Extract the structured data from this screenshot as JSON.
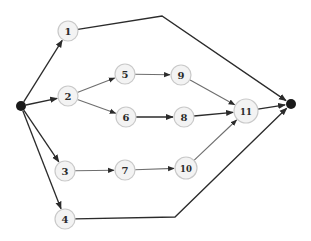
{
  "diagram": {
    "type": "network-graph",
    "colors": {
      "node_fill": "#f3f3f3",
      "node_stroke": "#c9c9c9",
      "terminal_fill": "#1a1a1a",
      "edge": "#2b2b2b",
      "label": "#2a2a2a"
    },
    "nodes": [
      {
        "id": "start",
        "label": "",
        "kind": "terminal",
        "x": 21,
        "y": 106,
        "r": 5
      },
      {
        "id": "1",
        "label": "1",
        "kind": "activity",
        "x": 68,
        "y": 31,
        "r": 10
      },
      {
        "id": "2",
        "label": "2",
        "kind": "activity",
        "x": 68,
        "y": 96,
        "r": 10
      },
      {
        "id": "3",
        "label": "3",
        "kind": "activity",
        "x": 65,
        "y": 171,
        "r": 10
      },
      {
        "id": "4",
        "label": "4",
        "kind": "activity",
        "x": 65,
        "y": 219,
        "r": 10
      },
      {
        "id": "5",
        "label": "5",
        "kind": "activity",
        "x": 125,
        "y": 74,
        "r": 10
      },
      {
        "id": "6",
        "label": "6",
        "kind": "activity",
        "x": 126,
        "y": 117,
        "r": 10
      },
      {
        "id": "7",
        "label": "7",
        "kind": "activity",
        "x": 125,
        "y": 170,
        "r": 10
      },
      {
        "id": "8",
        "label": "8",
        "kind": "activity",
        "x": 184,
        "y": 117,
        "r": 10
      },
      {
        "id": "9",
        "label": "9",
        "kind": "activity",
        "x": 181,
        "y": 75,
        "r": 10
      },
      {
        "id": "10",
        "label": "10",
        "kind": "activity",
        "x": 186,
        "y": 168,
        "r": 11
      },
      {
        "id": "11",
        "label": "11",
        "kind": "activity",
        "x": 246,
        "y": 111,
        "r": 12
      },
      {
        "id": "end",
        "label": "",
        "kind": "terminal",
        "x": 291,
        "y": 104,
        "r": 5
      }
    ],
    "edges": [
      {
        "from": "start",
        "to": "1",
        "waypoints": []
      },
      {
        "from": "start",
        "to": "2",
        "waypoints": []
      },
      {
        "from": "start",
        "to": "3",
        "waypoints": []
      },
      {
        "from": "start",
        "to": "4",
        "waypoints": []
      },
      {
        "from": "1",
        "to": "end",
        "waypoints": [
          [
            162,
            16
          ]
        ]
      },
      {
        "from": "2",
        "to": "5",
        "waypoints": []
      },
      {
        "from": "2",
        "to": "6",
        "waypoints": []
      },
      {
        "from": "5",
        "to": "9",
        "waypoints": []
      },
      {
        "from": "6",
        "to": "8",
        "waypoints": []
      },
      {
        "from": "9",
        "to": "11",
        "waypoints": []
      },
      {
        "from": "8",
        "to": "11",
        "waypoints": []
      },
      {
        "from": "3",
        "to": "7",
        "waypoints": []
      },
      {
        "from": "7",
        "to": "10",
        "waypoints": []
      },
      {
        "from": "10",
        "to": "11",
        "waypoints": []
      },
      {
        "from": "11",
        "to": "end",
        "waypoints": []
      },
      {
        "from": "4",
        "to": "end",
        "waypoints": [
          [
            175,
            217
          ]
        ]
      }
    ]
  },
  "labels": {
    "n1": "1",
    "n2": "2",
    "n3": "3",
    "n4": "4",
    "n5": "5",
    "n6": "6",
    "n7": "7",
    "n8": "8",
    "n9": "9",
    "n10": "10",
    "n11": "11"
  }
}
